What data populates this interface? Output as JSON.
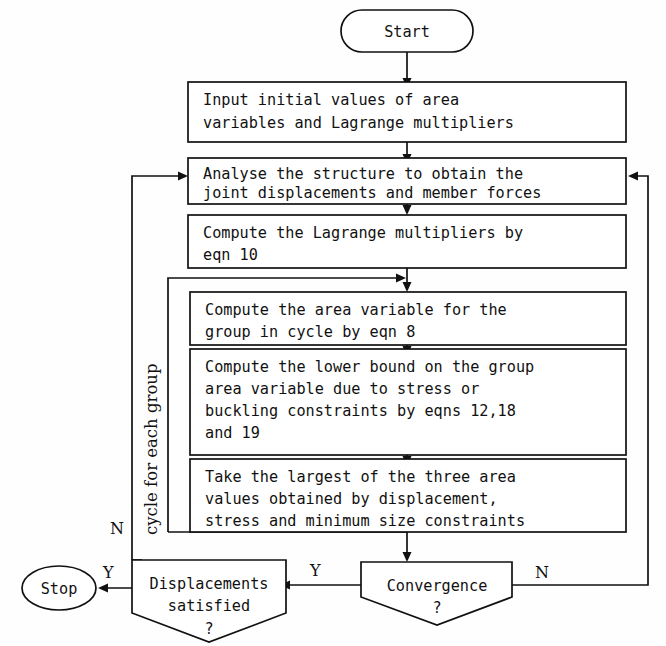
{
  "diagram": {
    "nodes": {
      "start": {
        "label": "Start",
        "shape": "stadium"
      },
      "input": {
        "lines": [
          "Input initial values of area",
          "variables and Lagrange multipliers"
        ],
        "shape": "process"
      },
      "analyse": {
        "lines": [
          "Analyse the structure to obtain the",
          "joint displacements and member forces"
        ],
        "shape": "process"
      },
      "lagrange": {
        "lines": [
          "Compute the Lagrange multipliers by",
          "eqn 10"
        ],
        "shape": "process"
      },
      "area_variable": {
        "lines": [
          "Compute the area variable for the",
          "group in cycle by eqn 8"
        ],
        "shape": "process"
      },
      "lower_bound": {
        "lines": [
          "Compute the lower bound on the group",
          "area variable due to stress or",
          "buckling constraints by eqns 12,18",
          "and 19"
        ],
        "shape": "process"
      },
      "largest": {
        "lines": [
          "Take the largest of the three area",
          "values obtained by displacement,",
          "stress and minimum size constraints"
        ],
        "shape": "process"
      },
      "convergence": {
        "lines": [
          "Convergence",
          "?"
        ],
        "shape": "decision-pentagon"
      },
      "displacements": {
        "lines": [
          "Displacements",
          "satisfied",
          "?"
        ],
        "shape": "decision-pentagon"
      },
      "stop": {
        "label": "Stop",
        "shape": "ellipse"
      }
    },
    "edge_labels": {
      "convergence_no": "N",
      "convergence_yes": "Y",
      "displacements_yes": "Y",
      "displacements_no": "N"
    },
    "loop_label": "cycle for each group",
    "colors": {
      "stroke": "#111111",
      "fill": "#ffffff",
      "background": "#fefefe"
    }
  }
}
